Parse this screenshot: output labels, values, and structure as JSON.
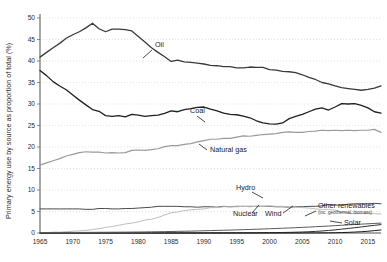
{
  "chart_data": {
    "type": "line",
    "title": "",
    "xlabel": "",
    "ylabel": "Primary energy use by source as proportion of total (%)",
    "xlim": [
      1965,
      2017
    ],
    "ylim": [
      0,
      50
    ],
    "grid": true,
    "legend_position": "inline-annotations",
    "xticks": [
      "1965",
      "1970",
      "1975",
      "1980",
      "1985",
      "1990",
      "1995",
      "2000",
      "2005",
      "2010",
      "2015"
    ],
    "xtick_values": [
      1965,
      1970,
      1975,
      1980,
      1985,
      1990,
      1995,
      2000,
      2005,
      2010,
      2015
    ],
    "yticks": [
      "0",
      "5",
      "10",
      "15",
      "20",
      "25",
      "30",
      "35",
      "40",
      "45",
      "50"
    ],
    "ytick_values": [
      0,
      5,
      10,
      15,
      20,
      25,
      30,
      35,
      40,
      45,
      50
    ],
    "x": [
      1965,
      1966,
      1967,
      1968,
      1969,
      1970,
      1971,
      1972,
      1973,
      1974,
      1975,
      1976,
      1977,
      1978,
      1979,
      1980,
      1981,
      1982,
      1983,
      1984,
      1985,
      1986,
      1987,
      1988,
      1989,
      1990,
      1991,
      1992,
      1993,
      1994,
      1995,
      1996,
      1997,
      1998,
      1999,
      2000,
      2001,
      2002,
      2003,
      2004,
      2005,
      2006,
      2007,
      2008,
      2009,
      2010,
      2011,
      2012,
      2013,
      2014,
      2015,
      2016,
      2017
    ],
    "series": [
      {
        "name": "Oil",
        "color": "#3a3a3a",
        "width": 1.3,
        "label": "Oil",
        "label_x": 155,
        "label_y": 47,
        "leader": "M 152 50 L 143 58",
        "values": [
          40.9,
          42.0,
          43.1,
          44.1,
          45.3,
          46.1,
          46.8,
          47.7,
          48.8,
          47.5,
          46.8,
          47.4,
          47.4,
          47.3,
          47.0,
          45.7,
          44.4,
          43.1,
          42.0,
          41.0,
          39.9,
          40.2,
          39.8,
          39.7,
          39.5,
          39.3,
          39.0,
          38.9,
          38.7,
          38.7,
          38.4,
          38.4,
          38.6,
          38.5,
          38.5,
          38.0,
          37.9,
          37.6,
          37.5,
          37.3,
          36.8,
          36.2,
          35.7,
          35.0,
          34.7,
          34.2,
          33.8,
          33.6,
          33.4,
          33.2,
          33.4,
          33.7,
          34.2
        ]
      },
      {
        "name": "Coal",
        "color": "#1f1f1f",
        "width": 1.3,
        "label": "Coal",
        "label_x": 190,
        "label_y": 113,
        "leader": "M 197 116 L 205 122",
        "values": [
          37.8,
          36.6,
          35.2,
          34.2,
          33.3,
          32.1,
          30.9,
          29.8,
          28.7,
          28.3,
          27.3,
          27.1,
          27.3,
          27.0,
          27.6,
          27.4,
          27.1,
          27.3,
          27.4,
          27.8,
          28.4,
          28.2,
          28.7,
          28.9,
          29.2,
          29.3,
          28.8,
          28.4,
          27.9,
          27.6,
          27.5,
          27.2,
          26.8,
          26.1,
          25.6,
          25.4,
          25.3,
          25.6,
          26.6,
          27.1,
          27.6,
          28.2,
          28.8,
          29.1,
          28.6,
          29.3,
          30.1,
          30.0,
          30.1,
          29.7,
          29.1,
          28.2,
          27.9
        ]
      },
      {
        "name": "Natural gas",
        "color": "#9a9a9a",
        "width": 1.2,
        "label": "Natural gas",
        "label_x": 210,
        "label_y": 152,
        "leader": "M 207 150 L 199 144",
        "values": [
          15.8,
          16.3,
          16.8,
          17.3,
          17.9,
          18.3,
          18.7,
          18.9,
          18.8,
          18.8,
          18.6,
          18.7,
          18.6,
          18.7,
          19.2,
          19.3,
          19.2,
          19.4,
          19.6,
          20.1,
          20.3,
          20.3,
          20.6,
          20.8,
          21.2,
          21.5,
          21.8,
          21.8,
          22.0,
          22.0,
          22.3,
          22.6,
          22.5,
          22.7,
          22.9,
          23.0,
          23.1,
          23.4,
          23.5,
          23.4,
          23.4,
          23.6,
          23.7,
          23.9,
          23.8,
          23.9,
          23.8,
          23.9,
          23.8,
          23.9,
          23.9,
          24.1,
          23.4
        ]
      },
      {
        "name": "Hydro",
        "color": "#4a4a4a",
        "width": 1.0,
        "label": "Hydro",
        "label_x": 236,
        "label_y": 190,
        "leader": "M 252 192 L 263 198",
        "values": [
          5.6,
          5.6,
          5.6,
          5.6,
          5.6,
          5.6,
          5.6,
          5.5,
          5.5,
          5.7,
          5.7,
          5.6,
          5.6,
          5.7,
          5.7,
          5.8,
          5.9,
          6.0,
          6.2,
          6.2,
          6.2,
          6.2,
          6.1,
          6.1,
          6.0,
          6.1,
          6.1,
          6.0,
          6.2,
          6.1,
          6.2,
          6.2,
          6.2,
          6.2,
          6.2,
          6.2,
          6.1,
          6.1,
          6.0,
          6.1,
          6.1,
          6.2,
          6.2,
          6.3,
          6.6,
          6.5,
          6.5,
          6.7,
          6.8,
          6.8,
          6.8,
          6.9,
          6.8
        ]
      },
      {
        "name": "Nuclear",
        "color": "#bdbdbd",
        "width": 1.0,
        "label": "Nuclear",
        "label_x": 233,
        "label_y": 216,
        "leader": "M 252 213 L 259 205",
        "values": [
          0.1,
          0.1,
          0.2,
          0.2,
          0.3,
          0.4,
          0.5,
          0.6,
          0.8,
          1.0,
          1.3,
          1.5,
          1.8,
          2.1,
          2.3,
          2.6,
          3.0,
          3.2,
          3.6,
          4.2,
          4.7,
          4.9,
          5.2,
          5.4,
          5.5,
          5.6,
          5.9,
          5.9,
          6.1,
          6.1,
          6.1,
          6.2,
          6.1,
          6.2,
          6.2,
          6.3,
          6.2,
          6.2,
          6.0,
          6.0,
          5.9,
          5.8,
          5.6,
          5.5,
          5.5,
          5.3,
          4.9,
          4.6,
          4.5,
          4.5,
          4.5,
          4.5,
          4.4
        ]
      },
      {
        "name": "Wind",
        "color": "#2e2e2e",
        "width": 1.0,
        "label": "Wind",
        "label_x": 265,
        "label_y": 216,
        "leader": "M 283 213 L 293 206",
        "values": [
          0,
          0,
          0,
          0,
          0,
          0,
          0,
          0,
          0,
          0,
          0,
          0,
          0,
          0,
          0,
          0,
          0,
          0,
          0,
          0,
          0,
          0,
          0,
          0,
          0,
          0.01,
          0.01,
          0.02,
          0.02,
          0.03,
          0.03,
          0.04,
          0.05,
          0.06,
          0.07,
          0.09,
          0.1,
          0.12,
          0.15,
          0.19,
          0.23,
          0.29,
          0.37,
          0.47,
          0.59,
          0.72,
          0.9,
          1.06,
          1.23,
          1.41,
          1.6,
          1.78,
          1.95
        ]
      },
      {
        "name": "Solar",
        "color": "#1a1a1a",
        "width": 1.0,
        "label": "Solar",
        "label_x": 344,
        "label_y": 225,
        "leader": "M 342 223 L 330 221",
        "values": [
          0,
          0,
          0,
          0,
          0,
          0,
          0,
          0,
          0,
          0,
          0,
          0,
          0,
          0,
          0,
          0,
          0,
          0,
          0,
          0,
          0,
          0,
          0,
          0,
          0,
          0,
          0,
          0,
          0,
          0,
          0,
          0,
          0,
          0,
          0,
          0,
          0,
          0,
          0.01,
          0.01,
          0.01,
          0.02,
          0.02,
          0.03,
          0.04,
          0.06,
          0.1,
          0.15,
          0.22,
          0.3,
          0.41,
          0.55,
          0.7
        ]
      },
      {
        "name": "Other renewables",
        "color": "#5a5a5a",
        "width": 1.0,
        "label": "Other renewables",
        "sublabel": "(inc. geothermal, biomass)",
        "label_x": 318,
        "label_y": 208,
        "sublabel_x": 318,
        "sublabel_y": 214,
        "leader": "M 316 211 L 305 216",
        "values": [
          0.1,
          0.1,
          0.1,
          0.11,
          0.12,
          0.12,
          0.13,
          0.14,
          0.15,
          0.16,
          0.17,
          0.18,
          0.19,
          0.2,
          0.22,
          0.23,
          0.25,
          0.27,
          0.29,
          0.32,
          0.35,
          0.38,
          0.41,
          0.44,
          0.48,
          0.52,
          0.56,
          0.6,
          0.64,
          0.68,
          0.73,
          0.78,
          0.83,
          0.88,
          0.93,
          0.99,
          1.05,
          1.11,
          1.17,
          1.24,
          1.31,
          1.38,
          1.46,
          1.54,
          1.62,
          1.71,
          1.8,
          1.89,
          1.98,
          2.06,
          2.14,
          2.22,
          2.3
        ]
      }
    ]
  }
}
